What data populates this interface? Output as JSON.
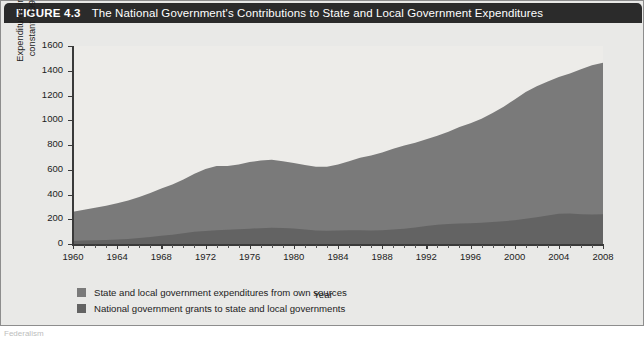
{
  "figure": {
    "number_label": "FIGURE 4.3",
    "title": "The National Government's Contributions to State and Local Government Expenditures",
    "watermark_text": "Federalism",
    "undertext": "Federalism"
  },
  "axes": {
    "ylabel": "Expenditures in billions of constant (1996) dollars",
    "xlabel": "Year",
    "yticks": [
      0,
      200,
      400,
      600,
      800,
      1000,
      1200,
      1400,
      1600
    ],
    "xticks": [
      1960,
      1964,
      1968,
      1972,
      1976,
      1980,
      1984,
      1988,
      1992,
      1996,
      2000,
      2004,
      2008
    ]
  },
  "legend": [
    {
      "label": "State and local government expenditures from own sources",
      "color": "#7a7a7a"
    },
    {
      "label": "National government grants to state and local governments",
      "color": "#636363"
    }
  ],
  "colors": {
    "own_sources": "#7a7a7a",
    "grants": "#636363",
    "plot_background": "#edece9",
    "figure_background": "#e9e9e7",
    "header_bar": "#2b2b2b",
    "axis": "#3a3a3a"
  },
  "chart_data": {
    "type": "area",
    "stacked": true,
    "title": "The National Government's Contributions to State and Local Government Expenditures",
    "xlabel": "Year",
    "ylabel": "Expenditures in billions of constant (1996) dollars",
    "xlim": [
      1960,
      2008
    ],
    "ylim": [
      0,
      1600
    ],
    "grid": false,
    "legend_position": "below",
    "x": [
      1960,
      1961,
      1962,
      1963,
      1964,
      1965,
      1966,
      1967,
      1968,
      1969,
      1970,
      1971,
      1972,
      1973,
      1974,
      1975,
      1976,
      1977,
      1978,
      1979,
      1980,
      1981,
      1982,
      1983,
      1984,
      1985,
      1986,
      1987,
      1988,
      1989,
      1990,
      1991,
      1992,
      1993,
      1994,
      1995,
      1996,
      1997,
      1998,
      1999,
      2000,
      2001,
      2002,
      2003,
      2004,
      2005,
      2006,
      2007,
      2008
    ],
    "series": [
      {
        "name": "National government grants to state and local governments",
        "values": [
          25,
          28,
          30,
          33,
          36,
          40,
          48,
          56,
          66,
          74,
          86,
          98,
          106,
          112,
          116,
          120,
          124,
          128,
          132,
          130,
          126,
          118,
          110,
          108,
          110,
          112,
          112,
          110,
          112,
          118,
          124,
          134,
          146,
          156,
          162,
          166,
          168,
          172,
          178,
          184,
          192,
          204,
          216,
          230,
          244,
          246,
          240,
          238,
          240
        ]
      },
      {
        "name": "State and local government expenditures from own sources",
        "values": [
          235,
          248,
          262,
          277,
          294,
          312,
          332,
          356,
          382,
          406,
          436,
          470,
          500,
          518,
          514,
          522,
          538,
          546,
          548,
          538,
          528,
          520,
          514,
          516,
          532,
          556,
          584,
          606,
          628,
          652,
          672,
          684,
          700,
          718,
          746,
          780,
          808,
          840,
          880,
          926,
          976,
          1024,
          1058,
          1084,
          1106,
          1132,
          1172,
          1206,
          1225
        ]
      }
    ],
    "totals": [
      260,
      276,
      292,
      310,
      330,
      352,
      380,
      412,
      448,
      480,
      522,
      568,
      606,
      630,
      630,
      642,
      662,
      674,
      680,
      668,
      654,
      638,
      624,
      624,
      642,
      668,
      696,
      716,
      740,
      770,
      796,
      818,
      846,
      874,
      908,
      946,
      976,
      1012,
      1058,
      1110,
      1168,
      1228,
      1274,
      1314,
      1350,
      1378,
      1412,
      1444,
      1465
    ]
  }
}
